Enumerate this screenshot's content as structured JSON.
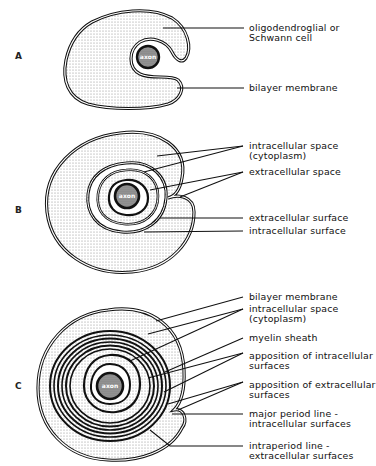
{
  "figure": {
    "panels": [
      {
        "letter": "A",
        "axon_label": "axon",
        "labels": [
          {
            "line1": "oligodendroglial  or",
            "line2": "Schwann  cell"
          },
          {
            "line1": "bilayer  membrane"
          }
        ]
      },
      {
        "letter": "B",
        "axon_label": "axon",
        "labels": [
          {
            "line1": "intracellular  space",
            "line2": "(cytoplasm)"
          },
          {
            "line1": "extracellular  space"
          },
          {
            "line1": "extracellular  surface"
          },
          {
            "line1": "intracellular  surface"
          }
        ]
      },
      {
        "letter": "C",
        "axon_label": "axon",
        "labels": [
          {
            "line1": "bilayer  membrane"
          },
          {
            "line1": "intracellular  space",
            "line2": "(cytoplasm)"
          },
          {
            "line1": "myelin  sheath"
          },
          {
            "line1": "apposition  of  intracellular",
            "line2": "surfaces"
          },
          {
            "line1": "apposition  of  extracellular",
            "line2": "surfaces"
          },
          {
            "line1": "major  period  line  -",
            "line2": "intracellular  surfaces"
          },
          {
            "line1": "intraperiod  line  -",
            "line2": "extracellular  surfaces"
          }
        ]
      }
    ],
    "colors": {
      "ink": "#111111",
      "background": "#ffffff",
      "stipple": "#9a9a9a",
      "axon_fill": "#7a7a7a"
    }
  }
}
